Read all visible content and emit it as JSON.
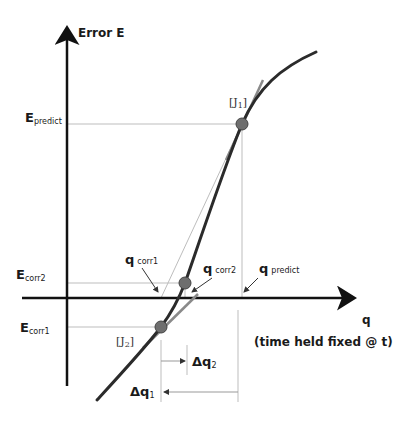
{
  "diagram": {
    "y_axis_label": "Error  E",
    "x_axis_label": "q",
    "note": "(time held fixed @ t)",
    "y_labels": {
      "e_predict": {
        "main": "E",
        "sub": "predict"
      },
      "e_corr2": {
        "main": "E",
        "sub": "corr2"
      },
      "e_corr1": {
        "main": "E",
        "sub": "corr1"
      }
    },
    "q_labels": {
      "q_corr1": {
        "main": "q",
        "sub": "corr1"
      },
      "q_corr2": {
        "main": "q",
        "sub": "corr2"
      },
      "q_predict": {
        "main": "q",
        "sub": "predict"
      }
    },
    "jacobian_labels": {
      "j1": {
        "open": "[J",
        "sub": "1",
        "close": "]"
      },
      "j2": {
        "open": "[J",
        "sub": "2",
        "close": "]"
      }
    },
    "delta_labels": {
      "dq2": {
        "main": "Δq",
        "sub": "2"
      },
      "dq1": {
        "main": "Δq",
        "sub": "1"
      }
    },
    "colors": {
      "curve": "#2b2b2b",
      "axis": "#111111",
      "tangent": "#8a8a8a",
      "guide": "#bdbdbd",
      "point": "#6e6e6e"
    }
  }
}
